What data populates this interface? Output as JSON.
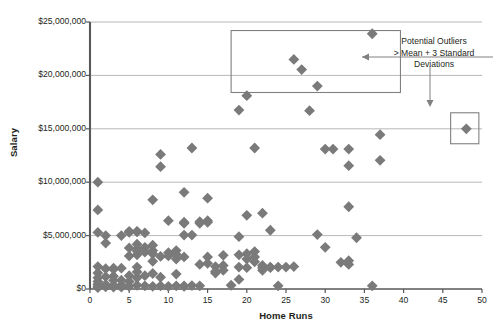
{
  "chart_data": {
    "type": "scatter",
    "title": "",
    "xlabel": "Home Runs",
    "ylabel": "Salary",
    "xlim": [
      0,
      50
    ],
    "ylim": [
      0,
      25000000
    ],
    "xticks": [
      0,
      5,
      10,
      15,
      20,
      25,
      30,
      35,
      40,
      45,
      50
    ],
    "xtick_labels": [
      "0",
      "5",
      "10",
      "15",
      "20",
      "25",
      "30",
      "35",
      "40",
      "45",
      "50"
    ],
    "yticks": [
      0,
      5000000,
      10000000,
      15000000,
      20000000,
      25000000
    ],
    "ytick_labels": [
      "$0",
      "$5,000,000",
      "$10,000,000",
      "$15,000,000",
      "$20,000,000",
      "$25,000,000"
    ],
    "grid": "horizontal",
    "legend": "none",
    "marker": "diamond",
    "marker_color": "#7a7a7a",
    "marker_size": 5.4,
    "gridline_color": "#a6a6a6",
    "axis_color": "#58595b",
    "annotation_box_color": "#808080",
    "annotations": [
      {
        "name": "outlier-callout",
        "text_lines": [
          "Potential Outliers",
          "> Mean + 3 Standard",
          "Deviations"
        ],
        "text_x": 434,
        "text_y": 36
      }
    ],
    "highlight_boxes": [
      {
        "name": "upper-outlier-box",
        "x": 18.0,
        "y0": 18400000,
        "y1": 24200000,
        "x1": 39.6
      },
      {
        "name": "right-outlier-box",
        "x": 46.0,
        "y0": 13600000,
        "y1": 16500000,
        "x1": 49.6
      }
    ],
    "points": [
      [
        1,
        10000000
      ],
      [
        1,
        7400000
      ],
      [
        1,
        5300000
      ],
      [
        2,
        5000000
      ],
      [
        2,
        4300000
      ],
      [
        1,
        2100000
      ],
      [
        1,
        1500000
      ],
      [
        1,
        1050000
      ],
      [
        1,
        700000
      ],
      [
        1,
        450000
      ],
      [
        1,
        250000
      ],
      [
        1,
        120000
      ],
      [
        2,
        1900000
      ],
      [
        2,
        1150000
      ],
      [
        2,
        420000
      ],
      [
        2,
        200000
      ],
      [
        3,
        1950000
      ],
      [
        3,
        1850000
      ],
      [
        3,
        1200000
      ],
      [
        3,
        800000
      ],
      [
        3,
        330000
      ],
      [
        3,
        180000
      ],
      [
        4,
        5000000
      ],
      [
        4,
        1950000
      ],
      [
        4,
        830000
      ],
      [
        4,
        380000
      ],
      [
        4,
        180000
      ],
      [
        5,
        5300000
      ],
      [
        5,
        5400000
      ],
      [
        5,
        3850000
      ],
      [
        5,
        3100000
      ],
      [
        5,
        1250000
      ],
      [
        5,
        700000
      ],
      [
        5,
        250000
      ],
      [
        6,
        5400000
      ],
      [
        6,
        5350000
      ],
      [
        6,
        4200000
      ],
      [
        6,
        3750000
      ],
      [
        6,
        3550000
      ],
      [
        6,
        3200000
      ],
      [
        6,
        2050000
      ],
      [
        6,
        1600000
      ],
      [
        6,
        1050000
      ],
      [
        6,
        350000
      ],
      [
        7,
        5250000
      ],
      [
        7,
        3900000
      ],
      [
        7,
        3450000
      ],
      [
        7,
        1250000
      ],
      [
        7,
        300000
      ],
      [
        8,
        8350000
      ],
      [
        8,
        4100000
      ],
      [
        8,
        3600000
      ],
      [
        8,
        3300000
      ],
      [
        8,
        2600000
      ],
      [
        8,
        1450000
      ],
      [
        8,
        250000
      ],
      [
        9,
        12600000
      ],
      [
        9,
        3050000
      ],
      [
        9,
        1100000
      ],
      [
        9,
        300000
      ],
      [
        10,
        6400000
      ],
      [
        10,
        3400000
      ],
      [
        10,
        3100000
      ],
      [
        10,
        250000
      ],
      [
        11,
        3600000
      ],
      [
        11,
        3250000
      ],
      [
        11,
        2800000
      ],
      [
        11,
        1400000
      ],
      [
        11,
        300000
      ],
      [
        12,
        9050000
      ],
      [
        12,
        6150000
      ],
      [
        12,
        6250000
      ],
      [
        12,
        5050000
      ],
      [
        12,
        3000000
      ],
      [
        12,
        280000
      ],
      [
        12,
        250000
      ],
      [
        13,
        13200000
      ],
      [
        13,
        5050000
      ],
      [
        13,
        320000
      ],
      [
        14,
        6150000
      ],
      [
        14,
        6300000
      ],
      [
        14,
        2300000
      ],
      [
        14,
        300000
      ],
      [
        15,
        8500000
      ],
      [
        15,
        6400000
      ],
      [
        15,
        6250000
      ],
      [
        15,
        3000000
      ],
      [
        15,
        2400000
      ],
      [
        16,
        2100000
      ],
      [
        16,
        1650000
      ],
      [
        16,
        1500000
      ],
      [
        17,
        3150000
      ],
      [
        17,
        2200000
      ],
      [
        17,
        1750000
      ],
      [
        18,
        350000
      ],
      [
        19,
        16750000
      ],
      [
        19,
        4900000
      ],
      [
        19,
        3200000
      ],
      [
        19,
        2050000
      ],
      [
        19,
        900000
      ],
      [
        20,
        18100000
      ],
      [
        20,
        6900000
      ],
      [
        20,
        3300000
      ],
      [
        20,
        2800000
      ],
      [
        20,
        2000000
      ],
      [
        21,
        13200000
      ],
      [
        21,
        3500000
      ],
      [
        21,
        3000000
      ],
      [
        21,
        2550000
      ],
      [
        22,
        7100000
      ],
      [
        22,
        2200000
      ],
      [
        22,
        2000000
      ],
      [
        22,
        1750000
      ],
      [
        23,
        5500000
      ],
      [
        23,
        2050000
      ],
      [
        23,
        2000000
      ],
      [
        24,
        2050000
      ],
      [
        24,
        300000
      ],
      [
        25,
        2050000
      ],
      [
        26,
        2100000
      ],
      [
        26,
        21500000
      ],
      [
        27,
        20550000
      ],
      [
        28,
        16700000
      ],
      [
        29,
        19000000
      ],
      [
        30,
        13100000
      ],
      [
        31,
        13100000
      ],
      [
        33,
        13100000
      ],
      [
        33,
        11550000
      ],
      [
        33,
        2650000
      ],
      [
        33,
        2300000
      ],
      [
        32,
        2500000
      ],
      [
        33,
        7700000
      ],
      [
        36,
        300000
      ],
      [
        36,
        23900000
      ],
      [
        37,
        14450000
      ],
      [
        37,
        12050000
      ],
      [
        48,
        15000000
      ],
      [
        9,
        11450000
      ],
      [
        29,
        5100000
      ],
      [
        34,
        4800000
      ],
      [
        30,
        3900000
      ]
    ]
  }
}
